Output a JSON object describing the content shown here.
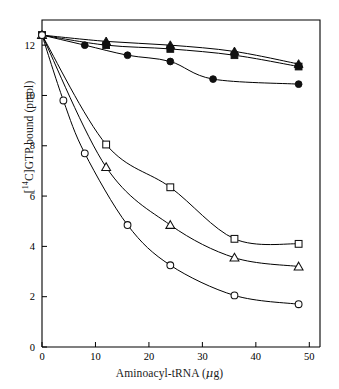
{
  "chart_data": {
    "type": "line",
    "title": "",
    "xlabel": "Aminoacyl-tRNA (μg)",
    "ylabel": "[14C]GTP bound (pmol)",
    "ylabel_prefix": "[",
    "ylabel_isotope": "14",
    "ylabel_suffix": "C]GTP bound (pmol)",
    "xlabel_text_before_mu": "Aminoacyl-tRNA (",
    "xlabel_mu": "μ",
    "xlabel_text_after_mu": "g)",
    "xlim": [
      0,
      52
    ],
    "ylim": [
      0,
      13.0
    ],
    "xticks": [
      0,
      10,
      20,
      30,
      40,
      50
    ],
    "xticklabels": [
      "0",
      "10",
      "20",
      "30",
      "40",
      "50"
    ],
    "yticks": [
      0,
      2,
      4,
      6,
      8,
      10,
      12
    ],
    "yticklabels": [
      "0",
      "2",
      "4",
      "6",
      "8",
      "10",
      "12"
    ],
    "grid": false,
    "legend": "none",
    "axis_color": "#000000",
    "line_color": "#000000",
    "series": [
      {
        "name": "filled-triangle",
        "marker": "triangle-filled",
        "x": [
          0,
          12,
          24,
          36,
          48
        ],
        "y": [
          12.4,
          12.15,
          12.0,
          11.75,
          11.25
        ]
      },
      {
        "name": "filled-square",
        "marker": "square-filled",
        "x": [
          0,
          12,
          24,
          36,
          48
        ],
        "y": [
          12.4,
          12.0,
          11.85,
          11.6,
          11.15
        ]
      },
      {
        "name": "filled-circle",
        "marker": "circle-filled",
        "x": [
          0,
          8,
          16,
          24,
          32,
          48
        ],
        "y": [
          12.4,
          12.0,
          11.6,
          11.35,
          10.65,
          10.45
        ]
      },
      {
        "name": "open-square",
        "marker": "square-open",
        "x": [
          0,
          12,
          24,
          36,
          48
        ],
        "y": [
          12.4,
          8.05,
          6.35,
          4.3,
          4.1
        ]
      },
      {
        "name": "open-triangle",
        "marker": "triangle-open",
        "x": [
          0,
          12,
          24,
          36,
          48
        ],
        "y": [
          12.4,
          7.15,
          4.85,
          3.55,
          3.2
        ]
      },
      {
        "name": "open-circle",
        "marker": "circle-open",
        "x": [
          0,
          4,
          8,
          16,
          24,
          36,
          48
        ],
        "y": [
          12.4,
          9.8,
          7.7,
          4.85,
          3.25,
          2.05,
          1.7
        ]
      }
    ]
  }
}
